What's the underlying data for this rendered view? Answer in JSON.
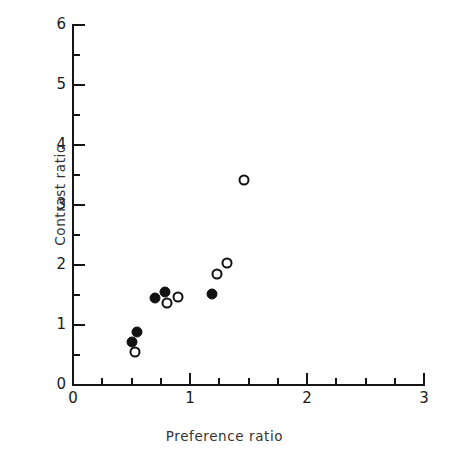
{
  "chart_data": {
    "type": "scatter",
    "title": "",
    "xlabel": "Preference ratio",
    "ylabel": "Contrast ratio",
    "xlim": [
      0,
      3
    ],
    "ylim": [
      0,
      6
    ],
    "xticks": [
      0,
      1,
      2,
      3
    ],
    "xtick_labels": [
      "0",
      "1",
      "2",
      "3"
    ],
    "xminor_step": 0.25,
    "yticks": [
      0,
      1,
      2,
      3,
      4,
      5,
      6
    ],
    "ytick_labels": [
      "0",
      "1",
      "2",
      "3",
      "4",
      "5",
      "6"
    ],
    "yminor_step": 0.5,
    "grid": false,
    "legend": "none",
    "series": [
      {
        "name": "filled",
        "marker": "filled-circle",
        "color": "#111111",
        "points": [
          {
            "x": 0.5,
            "y": 0.72
          },
          {
            "x": 0.55,
            "y": 0.88
          },
          {
            "x": 0.7,
            "y": 1.45
          },
          {
            "x": 0.79,
            "y": 1.55
          },
          {
            "x": 1.19,
            "y": 1.52
          }
        ]
      },
      {
        "name": "open",
        "marker": "open-circle",
        "color": "#111111",
        "points": [
          {
            "x": 0.53,
            "y": 0.55
          },
          {
            "x": 0.8,
            "y": 1.37
          },
          {
            "x": 0.9,
            "y": 1.47
          },
          {
            "x": 1.23,
            "y": 1.85
          },
          {
            "x": 1.32,
            "y": 2.04
          },
          {
            "x": 1.46,
            "y": 3.42
          }
        ]
      }
    ]
  }
}
